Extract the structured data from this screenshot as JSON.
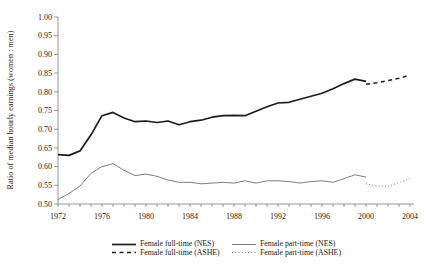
{
  "chart_data": {
    "type": "line",
    "title": "",
    "xlabel": "",
    "ylabel": "Ratio of median hourly earnings (women : men)",
    "xlim": [
      1972,
      2004
    ],
    "ylim": [
      0.5,
      1.0
    ],
    "yticks": [
      "0.50",
      "0.55",
      "0.60",
      "0.65",
      "0.70",
      "0.75",
      "0.80",
      "0.85",
      "0.90",
      "0.95",
      "1.00"
    ],
    "xticks_labeled": [
      "1972",
      "1976",
      "1980",
      "1984",
      "1988",
      "1992",
      "1996",
      "2000",
      "2004"
    ],
    "minor_xtick_every_years": 1,
    "grid": false,
    "legend_position": "bottom",
    "axis_color": "#7c7c7c",
    "text_color": "#1a1a1a",
    "series": [
      {
        "name": "Female full-time (NES)",
        "style": "solid-thick",
        "color": "#1c1c1c",
        "x": [
          1972,
          1973,
          1974,
          1975,
          1976,
          1977,
          1978,
          1979,
          1980,
          1981,
          1982,
          1983,
          1984,
          1985,
          1986,
          1987,
          1988,
          1989,
          1990,
          1991,
          1992,
          1993,
          1994,
          1995,
          1996,
          1997,
          1998,
          1999,
          2000
        ],
        "values": [
          0.632,
          0.63,
          0.642,
          0.685,
          0.736,
          0.745,
          0.73,
          0.72,
          0.722,
          0.718,
          0.722,
          0.712,
          0.72,
          0.724,
          0.732,
          0.736,
          0.737,
          0.736,
          0.748,
          0.76,
          0.77,
          0.772,
          0.78,
          0.788,
          0.796,
          0.808,
          0.822,
          0.834,
          0.828
        ]
      },
      {
        "name": "Female full-time (ASHE)",
        "style": "dashed-thick",
        "color": "#1c1c1c",
        "x": [
          2000,
          2001,
          2002,
          2003,
          2004
        ],
        "values": [
          0.82,
          0.824,
          0.83,
          0.836,
          0.845
        ]
      },
      {
        "name": "Female part-time (NES)",
        "style": "solid-thin",
        "color": "#6e6e6e",
        "x": [
          1972,
          1973,
          1974,
          1975,
          1976,
          1977,
          1978,
          1979,
          1980,
          1981,
          1982,
          1983,
          1984,
          1985,
          1986,
          1987,
          1988,
          1989,
          1990,
          1991,
          1992,
          1993,
          1994,
          1995,
          1996,
          1997,
          1998,
          1999,
          2000
        ],
        "values": [
          0.512,
          0.528,
          0.548,
          0.582,
          0.6,
          0.608,
          0.59,
          0.576,
          0.58,
          0.574,
          0.564,
          0.558,
          0.558,
          0.554,
          0.556,
          0.558,
          0.556,
          0.562,
          0.556,
          0.562,
          0.562,
          0.56,
          0.556,
          0.56,
          0.562,
          0.558,
          0.568,
          0.578,
          0.572
        ]
      },
      {
        "name": "Female part-time (ASHE)",
        "style": "dotted-thin",
        "color": "#6e6e6e",
        "x": [
          2000,
          2001,
          2002,
          2003,
          2004
        ],
        "values": [
          0.554,
          0.548,
          0.547,
          0.557,
          0.568
        ]
      }
    ]
  }
}
